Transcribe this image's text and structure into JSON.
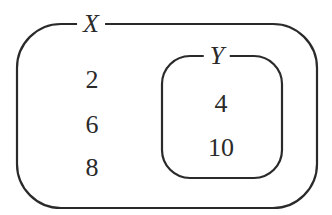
{
  "diagram": {
    "type": "set-diagram",
    "outer_set": {
      "name": "X",
      "elements": [
        "2",
        "6",
        "8"
      ]
    },
    "inner_set": {
      "name": "Y",
      "elements": [
        "4",
        "10"
      ]
    },
    "relation": "Y is a subset of X",
    "stroke_color": "#2a2a2a"
  }
}
